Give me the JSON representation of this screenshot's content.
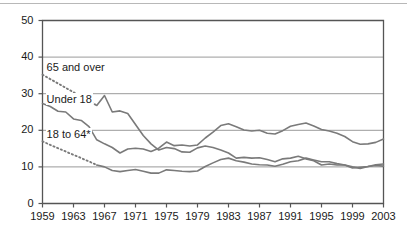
{
  "chart_data": {
    "type": "line",
    "title": "",
    "xlabel": "",
    "ylabel": "",
    "xlim": [
      1959,
      2003
    ],
    "ylim": [
      0,
      50
    ],
    "ytick_labels": [
      "0",
      "10",
      "20",
      "30",
      "40",
      "50"
    ],
    "ytick_values": [
      0,
      10,
      20,
      30,
      40,
      50
    ],
    "xtick_labels": [
      "1959",
      "1963",
      "1967",
      "1971",
      "1975",
      "1979",
      "1983",
      "1987",
      "1991",
      "1995",
      "1999",
      "2003"
    ],
    "xtick_values": [
      1959,
      1963,
      1967,
      1971,
      1975,
      1979,
      1983,
      1987,
      1991,
      1995,
      1999,
      2003
    ],
    "grid": "horizontal",
    "legend_position": "inline-annotations",
    "line_color": "#7a7a7a",
    "frame_color": "#555555",
    "grid_color": "#9a9a9a",
    "series": [
      {
        "name": "65 and over",
        "label": "65 and over",
        "label_x": 1959.4,
        "label_y": 37.0,
        "dashed_until": 1966,
        "x": [
          1959,
          1960,
          1961,
          1962,
          1963,
          1964,
          1965,
          1966,
          1967,
          1968,
          1969,
          1970,
          1971,
          1972,
          1973,
          1974,
          1975,
          1976,
          1977,
          1978,
          1979,
          1980,
          1981,
          1982,
          1983,
          1984,
          1985,
          1986,
          1987,
          1988,
          1989,
          1990,
          1991,
          1992,
          1993,
          1994,
          1995,
          1996,
          1997,
          1998,
          1999,
          2000,
          2001,
          2002,
          2003
        ],
        "values": [
          35.2,
          34.0,
          32.8,
          31.6,
          30.4,
          29.2,
          28.0,
          26.8,
          29.5,
          25.0,
          25.3,
          24.6,
          21.6,
          18.6,
          16.3,
          14.6,
          15.3,
          15.0,
          14.1,
          14.0,
          15.2,
          15.7,
          15.3,
          14.6,
          13.8,
          12.4,
          12.6,
          12.4,
          12.5,
          12.0,
          11.4,
          12.2,
          12.4,
          12.9,
          12.2,
          11.7,
          10.5,
          10.8,
          10.5,
          10.5,
          9.7,
          9.9,
          10.1,
          10.4,
          10.2
        ]
      },
      {
        "name": "Under 18",
        "label": "Under 18",
        "label_x": 1959.4,
        "label_y": 28.3,
        "dashed_until": null,
        "x": [
          1959,
          1960,
          1961,
          1962,
          1963,
          1964,
          1965,
          1966,
          1967,
          1968,
          1969,
          1970,
          1971,
          1972,
          1973,
          1974,
          1975,
          1976,
          1977,
          1978,
          1979,
          1980,
          1981,
          1982,
          1983,
          1984,
          1985,
          1986,
          1987,
          1988,
          1989,
          1990,
          1991,
          1992,
          1993,
          1994,
          1995,
          1996,
          1997,
          1998,
          1999,
          2000,
          2001,
          2002,
          2003
        ],
        "values": [
          27.3,
          26.5,
          25.2,
          25.0,
          23.1,
          22.7,
          21.0,
          17.4,
          16.3,
          15.3,
          13.8,
          14.9,
          15.1,
          14.9,
          14.2,
          15.1,
          16.8,
          15.8,
          16.0,
          15.7,
          16.0,
          17.9,
          19.5,
          21.3,
          21.8,
          21.0,
          20.1,
          19.8,
          20.0,
          19.2,
          19.0,
          19.9,
          21.1,
          21.6,
          22.0,
          21.2,
          20.2,
          19.8,
          19.2,
          18.3,
          16.9,
          16.2,
          16.3,
          16.7,
          17.6
        ]
      },
      {
        "name": "18 to 64*",
        "label": "18 to 64*",
        "label_x": 1959.4,
        "label_y": 18.6,
        "dashed_until": 1966,
        "x": [
          1959,
          1960,
          1961,
          1962,
          1963,
          1964,
          1965,
          1966,
          1967,
          1968,
          1969,
          1970,
          1971,
          1972,
          1973,
          1974,
          1975,
          1976,
          1977,
          1978,
          1979,
          1980,
          1981,
          1982,
          1983,
          1984,
          1985,
          1986,
          1987,
          1988,
          1989,
          1990,
          1991,
          1992,
          1993,
          1994,
          1995,
          1996,
          1997,
          1998,
          1999,
          2000,
          2001,
          2002,
          2003
        ],
        "values": [
          17.0,
          16.0,
          15.1,
          14.2,
          13.3,
          12.4,
          11.5,
          10.5,
          10.0,
          9.0,
          8.7,
          9.0,
          9.3,
          8.8,
          8.3,
          8.3,
          9.2,
          9.0,
          8.8,
          8.7,
          8.9,
          10.1,
          11.1,
          12.0,
          12.4,
          11.7,
          11.3,
          10.8,
          10.6,
          10.5,
          10.2,
          10.7,
          11.4,
          11.7,
          12.4,
          11.9,
          11.4,
          11.4,
          10.9,
          10.5,
          10.0,
          9.6,
          10.1,
          10.6,
          10.8
        ]
      }
    ]
  }
}
